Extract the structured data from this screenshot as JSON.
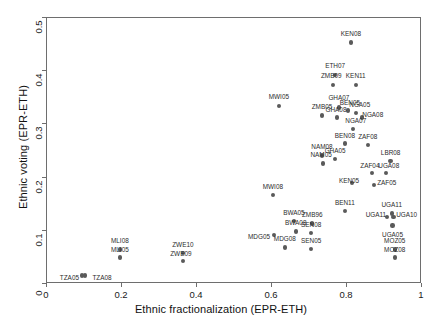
{
  "chart_data": {
    "type": "scatter",
    "title": "",
    "xlabel": "Ethnic fractionalization (EPR-ETH)",
    "ylabel": "Ethnic voting (EPR-ETH)",
    "xlim": [
      0,
      1
    ],
    "ylim": [
      0,
      0.5
    ],
    "xticks": [
      "0",
      "0.2",
      "0.4",
      "0.6",
      "0.8",
      "1"
    ],
    "xtick_values": [
      0,
      0.2,
      0.4,
      0.6,
      0.8,
      1
    ],
    "yticks": [
      "0",
      "0.1",
      "0.2",
      "0.3",
      "0.4",
      "0.5"
    ],
    "ytick_values": [
      0,
      0.1,
      0.2,
      0.3,
      0.4,
      0.5
    ],
    "grid": false,
    "legend": "none",
    "marker_color": "#5a5a5a",
    "points": [
      {
        "label": "KEN08",
        "x": 0.813,
        "y": 0.452,
        "lpos": "c",
        "ldx": 0,
        "ldy": -9
      },
      {
        "label": "ETH07",
        "x": 0.771,
        "y": 0.391,
        "lpos": "c",
        "ldx": 0,
        "ldy": -9
      },
      {
        "label": "ZMB09",
        "x": 0.766,
        "y": 0.372,
        "lpos": "c",
        "ldx": -2,
        "ldy": -9
      },
      {
        "label": "KEN11",
        "x": 0.826,
        "y": 0.372,
        "lpos": "c",
        "ldx": 0,
        "ldy": -9
      },
      {
        "label": "MWI05",
        "x": 0.621,
        "y": 0.333,
        "lpos": "c",
        "ldx": 0,
        "ldy": -9
      },
      {
        "label": "GHA07",
        "x": 0.781,
        "y": 0.33,
        "lpos": "c",
        "ldx": 0,
        "ldy": -9
      },
      {
        "label": "BEN05",
        "x": 0.805,
        "y": 0.324,
        "lpos": "c",
        "ldx": 2,
        "ldy": -8
      },
      {
        "label": "NGA05",
        "x": 0.826,
        "y": 0.32,
        "lpos": "c",
        "ldx": 4,
        "ldy": -8
      },
      {
        "label": "ZMB05",
        "x": 0.736,
        "y": 0.315,
        "lpos": "c",
        "ldx": 0,
        "ldy": -8
      },
      {
        "label": "GHA08",
        "x": 0.776,
        "y": 0.311,
        "lpos": "c",
        "ldx": -1,
        "ldy": -8
      },
      {
        "label": "NGA08",
        "x": 0.842,
        "y": 0.311,
        "lpos": "c",
        "ldx": 11,
        "ldy": -3
      },
      {
        "label": "NGA07",
        "x": 0.818,
        "y": 0.289,
        "lpos": "c",
        "ldx": 3,
        "ldy": -8
      },
      {
        "label": "BEN08",
        "x": 0.797,
        "y": 0.262,
        "lpos": "c",
        "ldx": 0,
        "ldy": -8
      },
      {
        "label": "ZAF08",
        "x": 0.858,
        "y": 0.259,
        "lpos": "c",
        "ldx": 0,
        "ldy": -8
      },
      {
        "label": "NAM08",
        "x": 0.736,
        "y": 0.24,
        "lpos": "c",
        "ldx": 0,
        "ldy": -8
      },
      {
        "label": "GHA05",
        "x": 0.771,
        "y": 0.233,
        "lpos": "c",
        "ldx": 0,
        "ldy": -8
      },
      {
        "label": "NAM05",
        "x": 0.739,
        "y": 0.225,
        "lpos": "c",
        "ldx": -2,
        "ldy": -8
      },
      {
        "label": "LBR08",
        "x": 0.919,
        "y": 0.229,
        "lpos": "c",
        "ldx": 0,
        "ldy": -8
      },
      {
        "label": "UGA08",
        "x": 0.906,
        "y": 0.207,
        "lpos": "c",
        "ldx": 3,
        "ldy": -7
      },
      {
        "label": "ZAF04",
        "x": 0.869,
        "y": 0.207,
        "lpos": "c",
        "ldx": -2,
        "ldy": -7
      },
      {
        "label": "KEN05",
        "x": 0.816,
        "y": 0.188,
        "lpos": "c",
        "ldx": -3,
        "ldy": -2
      },
      {
        "label": "ZAF05",
        "x": 0.874,
        "y": 0.184,
        "lpos": "c",
        "ldx": 13,
        "ldy": -2
      },
      {
        "label": "MWI08",
        "x": 0.605,
        "y": 0.165,
        "lpos": "c",
        "ldx": 0,
        "ldy": -8
      },
      {
        "label": "BEN11",
        "x": 0.797,
        "y": 0.135,
        "lpos": "c",
        "ldx": 0,
        "ldy": -8
      },
      {
        "label": "UGA11",
        "x": 0.922,
        "y": 0.131,
        "lpos": "c",
        "ldx": 0,
        "ldy": -8
      },
      {
        "label": "UGA11",
        "x": 0.909,
        "y": 0.124,
        "lpos": "c",
        "ldx": -11,
        "ldy": -2
      },
      {
        "label": "UGA10",
        "x": 0.927,
        "y": 0.124,
        "lpos": "c",
        "ldx": 13,
        "ldy": -2
      },
      {
        "label": "UGA05",
        "x": 0.924,
        "y": 0.108,
        "lpos": "c",
        "ldx": 0,
        "ldy": 9
      },
      {
        "label": "BWA05",
        "x": 0.661,
        "y": 0.116,
        "lpos": "c",
        "ldx": 0,
        "ldy": -8
      },
      {
        "label": "ZMB96",
        "x": 0.71,
        "y": 0.112,
        "lpos": "c",
        "ldx": 0,
        "ldy": -8
      },
      {
        "label": "BWA08",
        "x": 0.666,
        "y": 0.097,
        "lpos": "c",
        "ldx": 0,
        "ldy": -8
      },
      {
        "label": "SEN08",
        "x": 0.707,
        "y": 0.094,
        "lpos": "c",
        "ldx": 0,
        "ldy": -8
      },
      {
        "label": "MDG05",
        "x": 0.608,
        "y": 0.09,
        "lpos": "l",
        "ldx": -4,
        "ldy": 2
      },
      {
        "label": "MDG08",
        "x": 0.637,
        "y": 0.067,
        "lpos": "c",
        "ldx": 0,
        "ldy": -8
      },
      {
        "label": "SEN05",
        "x": 0.707,
        "y": 0.064,
        "lpos": "c",
        "ldx": 0,
        "ldy": -8
      },
      {
        "label": "MOZ05",
        "x": 0.93,
        "y": 0.063,
        "lpos": "c",
        "ldx": 0,
        "ldy": -8
      },
      {
        "label": "MOZ08",
        "x": 0.93,
        "y": 0.048,
        "lpos": "c",
        "ldx": 0,
        "ldy": -7
      },
      {
        "label": "MLI08",
        "x": 0.197,
        "y": 0.063,
        "lpos": "c",
        "ldx": 0,
        "ldy": -8
      },
      {
        "label": "MLI05",
        "x": 0.197,
        "y": 0.048,
        "lpos": "c",
        "ldx": 0,
        "ldy": -7
      },
      {
        "label": "ZWE10",
        "x": 0.365,
        "y": 0.056,
        "lpos": "c",
        "ldx": 0,
        "ldy": -8
      },
      {
        "label": "ZWE09",
        "x": 0.365,
        "y": 0.041,
        "lpos": "c",
        "ldx": -2,
        "ldy": -7
      },
      {
        "label": "TZA05",
        "x": 0.096,
        "y": 0.014,
        "lpos": "l",
        "ldx": -3,
        "ldy": 2
      },
      {
        "label": "TZA08",
        "x": 0.104,
        "y": 0.014,
        "lpos": "c",
        "ldx": 17,
        "ldy": 2
      }
    ]
  }
}
